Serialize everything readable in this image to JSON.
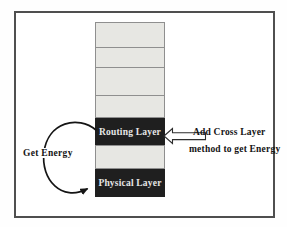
{
  "diagram": {
    "stack": {
      "description": "protocol layer stack",
      "layers": [
        {
          "label": "",
          "style": "light"
        },
        {
          "label": "",
          "style": "light"
        },
        {
          "label": "",
          "style": "light"
        },
        {
          "label": "",
          "style": "light"
        },
        {
          "label": "Routing Layer",
          "style": "dark"
        },
        {
          "label": "",
          "style": "light"
        },
        {
          "label": "Physical Layer",
          "style": "dark"
        }
      ]
    },
    "annotations": {
      "get_energy": "Get Energy",
      "cross_layer_line1": "Add Cross Layer",
      "cross_layer_line2": "method to get Energy"
    },
    "icons": {
      "loop_arrow": "circular-loop-arrow from Routing Layer to Physical Layer",
      "block_arrow": "hollow left-pointing block arrow into Routing Layer"
    },
    "colors": {
      "layer_light": "#e7e7e3",
      "layer_dark": "#1f1f1f",
      "cell_border": "#8f8f8f",
      "frame_border": "#4f4f4f",
      "label_on_dark": "#e6e6e6",
      "annotation_text": "#141414"
    }
  }
}
